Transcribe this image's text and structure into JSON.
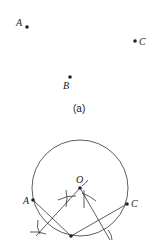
{
  "panel_a": {
    "caption": "(a)",
    "points": [
      {
        "label": "A",
        "x": 27,
        "y": 27
      },
      {
        "label": "B",
        "x": 70,
        "y": 77
      },
      {
        "label": "C",
        "x": 135,
        "y": 41
      }
    ]
  },
  "panel_b": {
    "circle": {
      "cx": 80,
      "cy": 188,
      "r": 48
    },
    "points": [
      {
        "label": "O",
        "x": 80,
        "y": 188
      },
      {
        "label": "A",
        "x": 33,
        "y": 200
      },
      {
        "label": "C",
        "x": 127,
        "y": 204
      },
      {
        "label": "B",
        "x": 71,
        "y": 236
      }
    ]
  },
  "colors": {
    "ink": "#222222",
    "background": "#ffffff"
  }
}
